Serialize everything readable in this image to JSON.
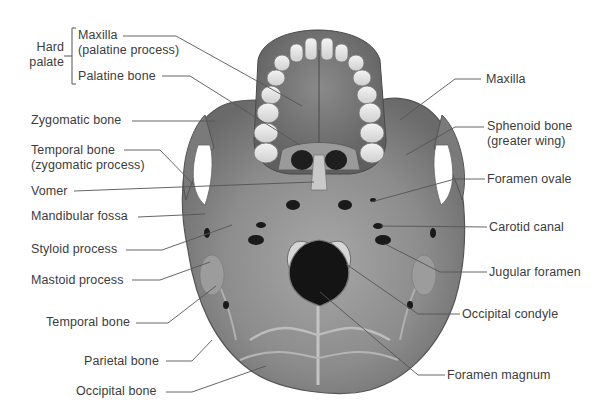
{
  "diagram": {
    "group_bracket": {
      "label_line1": "Hard",
      "label_line2": "palate",
      "members": [
        "Maxilla (palatine process)",
        "Palatine bone"
      ]
    },
    "labels_left": [
      {
        "id": "maxilla-palatine",
        "line1": "Maxilla",
        "line2": "(palatine process)"
      },
      {
        "id": "palatine-bone",
        "line1": "Palatine bone"
      },
      {
        "id": "zygomatic-bone",
        "line1": "Zygomatic bone"
      },
      {
        "id": "temporal-zygomatic",
        "line1": "Temporal bone",
        "line2": "(zygomatic process)"
      },
      {
        "id": "vomer",
        "line1": "Vomer"
      },
      {
        "id": "mandibular-fossa",
        "line1": "Mandibular fossa"
      },
      {
        "id": "styloid-process",
        "line1": "Styloid process"
      },
      {
        "id": "mastoid-process",
        "line1": "Mastoid process"
      },
      {
        "id": "temporal-bone",
        "line1": "Temporal bone"
      },
      {
        "id": "parietal-bone",
        "line1": "Parietal bone"
      },
      {
        "id": "occipital-bone",
        "line1": "Occipital bone"
      }
    ],
    "labels_right": [
      {
        "id": "maxilla",
        "line1": "Maxilla"
      },
      {
        "id": "sphenoid-greater-wing",
        "line1": "Sphenoid bone",
        "line2": "(greater wing)"
      },
      {
        "id": "foramen-ovale",
        "line1": "Foramen ovale"
      },
      {
        "id": "carotid-canal",
        "line1": "Carotid canal"
      },
      {
        "id": "jugular-foramen",
        "line1": "Jugular foramen"
      },
      {
        "id": "occipital-condyle",
        "line1": "Occipital condyle"
      },
      {
        "id": "foramen-magnum",
        "line1": "Foramen magnum"
      }
    ],
    "colors": {
      "bone_dark": "#6f6f6f",
      "bone_mid": "#8e8e8e",
      "bone_light": "#b9b9b9",
      "teeth": "#e8e8e8",
      "foramen": "#1a1a1a",
      "leader_line": "#555555",
      "text": "#3c3c3c"
    }
  }
}
